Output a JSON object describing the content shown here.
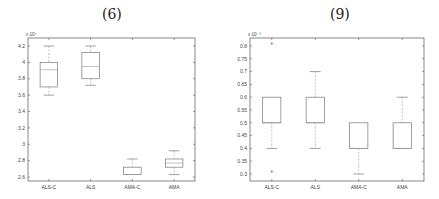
{
  "chart_data": [
    {
      "type": "box",
      "title": "(6)",
      "xlabel": "",
      "ylabel": "",
      "y_multiplier_label": "x 10^4",
      "categories": [
        "ALS-C",
        "ALS",
        "AMA-C",
        "AMA"
      ],
      "yticks": [
        2.6,
        2.8,
        3,
        3.2,
        3.4,
        3.6,
        3.8,
        4,
        4.2
      ],
      "ytick_labels": [
        "2.6",
        "2.8",
        "3",
        "3.2",
        "3.4",
        "3.6",
        "3.8",
        "4",
        "4.2"
      ],
      "ylim": [
        2.55,
        4.3
      ],
      "boxes": [
        {
          "name": "ALS-C",
          "whisker_low": 3.6,
          "q1": 3.7,
          "median": 3.91,
          "q3": 4.0,
          "whisker_high": 4.2,
          "outliers": []
        },
        {
          "name": "ALS",
          "whisker_low": 3.72,
          "q1": 3.8,
          "median": 3.95,
          "q3": 4.12,
          "whisker_high": 4.2,
          "outliers": []
        },
        {
          "name": "AMA-C",
          "whisker_low": 2.63,
          "q1": 2.63,
          "median": 2.63,
          "q3": 2.72,
          "whisker_high": 2.82,
          "outliers": []
        },
        {
          "name": "AMA",
          "whisker_low": 2.63,
          "q1": 2.72,
          "median": 2.77,
          "q3": 2.82,
          "whisker_high": 2.92,
          "outliers": []
        }
      ],
      "grid": false
    },
    {
      "type": "box",
      "title": "(9)",
      "xlabel": "",
      "ylabel": "",
      "y_multiplier_label": "x 10^-3",
      "categories": [
        "ALS-C",
        "ALS",
        "AMA-C",
        "AMA"
      ],
      "yticks": [
        0.3,
        0.35,
        0.4,
        0.45,
        0.5,
        0.55,
        0.6,
        0.65,
        0.7,
        0.75,
        0.8
      ],
      "ytick_labels": [
        "0.3",
        "0.35",
        "0.4",
        "0.45",
        "0.5",
        "0.55",
        "0.6",
        "0.65",
        "0.7",
        "0.75",
        "0.8"
      ],
      "ylim": [
        0.28,
        0.83
      ],
      "boxes": [
        {
          "name": "ALS-C",
          "whisker_low": 0.4,
          "q1": 0.5,
          "median": 0.5,
          "q3": 0.6,
          "whisker_high": 0.6,
          "outliers": [
            0.81,
            0.31
          ]
        },
        {
          "name": "ALS",
          "whisker_low": 0.4,
          "q1": 0.5,
          "median": 0.5,
          "q3": 0.6,
          "whisker_high": 0.7,
          "outliers": []
        },
        {
          "name": "AMA-C",
          "whisker_low": 0.3,
          "q1": 0.4,
          "median": 0.4,
          "q3": 0.5,
          "whisker_high": 0.5,
          "outliers": []
        },
        {
          "name": "AMA",
          "whisker_low": 0.4,
          "q1": 0.4,
          "median": 0.4,
          "q3": 0.5,
          "whisker_high": 0.6,
          "outliers": []
        }
      ],
      "grid": false
    }
  ],
  "panels": {
    "left": {
      "title": "(6)",
      "exp": "x 10⁴"
    },
    "right": {
      "title": "(9)",
      "exp": "x 10⁻³"
    }
  },
  "colors": {
    "axis": "#555555",
    "box": "#777777",
    "whisker": "#999999"
  }
}
